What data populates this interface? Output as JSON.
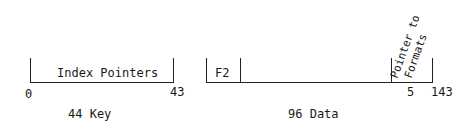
{
  "diagram": {
    "key_record": {
      "field_label": "Index Pointers",
      "start_offset": "0",
      "end_offset": "43",
      "caption": "44 Key"
    },
    "data_record": {
      "first_field_label": "F2",
      "pointer_field_label_line1": "Pointer to",
      "pointer_field_label_line2": "Formats",
      "pointer_size": "5",
      "end_offset": "143",
      "caption": "96 Data"
    }
  }
}
